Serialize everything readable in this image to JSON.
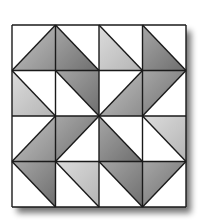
{
  "diagram": {
    "type": "quilt-block",
    "rows": 4,
    "cols": 4,
    "grid": {
      "x": 12,
      "y": 25,
      "width": 174,
      "height": 182
    },
    "colors": {
      "white": "#ffffff",
      "light": "#c8c8c8",
      "medium": "#a8a8a8",
      "dark": "#8a8a8a",
      "line": "#1a1a1a",
      "shadow": "#777777"
    },
    "cells": [
      [
        {
          "diagonal": "bl-tr",
          "shaded": "br",
          "tone": "medium"
        },
        {
          "diagonal": "tl-br",
          "shaded": "bl",
          "tone": "dark"
        },
        {
          "diagonal": "tl-br",
          "shaded": "bl",
          "tone": "light"
        },
        {
          "diagonal": "tl-br",
          "shaded": "bl",
          "tone": "dark"
        }
      ],
      [
        {
          "diagonal": "tl-br",
          "shaded": "bl",
          "tone": "light"
        },
        {
          "diagonal": "tl-br",
          "shaded": "tr",
          "tone": "dark"
        },
        {
          "diagonal": "bl-tr",
          "shaded": "br",
          "tone": "medium"
        },
        {
          "diagonal": "bl-tr",
          "shaded": "tl",
          "tone": "dark"
        }
      ],
      [
        {
          "diagonal": "bl-tr",
          "shaded": "br",
          "tone": "medium"
        },
        {
          "diagonal": "bl-tr",
          "shaded": "tl",
          "tone": "dark"
        },
        {
          "diagonal": "tl-br",
          "shaded": "bl",
          "tone": "dark"
        },
        {
          "diagonal": "tl-br",
          "shaded": "tr",
          "tone": "light"
        }
      ],
      [
        {
          "diagonal": "tl-br",
          "shaded": "tr",
          "tone": "dark"
        },
        {
          "diagonal": "tl-br",
          "shaded": "tr",
          "tone": "light"
        },
        {
          "diagonal": "tl-br",
          "shaded": "tr",
          "tone": "dark"
        },
        {
          "diagonal": "bl-tr",
          "shaded": "tl",
          "tone": "dark"
        }
      ]
    ]
  }
}
